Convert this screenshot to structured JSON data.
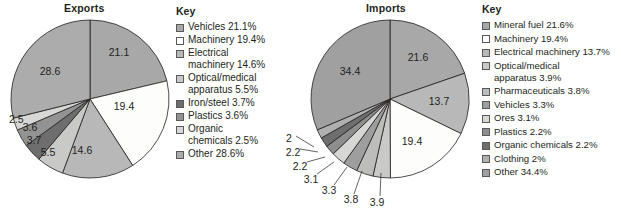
{
  "charts": [
    {
      "id": "exports",
      "title": "Exports",
      "key_title": "Key",
      "legend": [
        {
          "label": "Vehicles 21.1%",
          "color": "#a8a8a8"
        },
        {
          "label": "Machinery 19.4%",
          "color": "#fdfdfb"
        },
        {
          "label": "Electrical\nmachinery 14.6%",
          "color": "#b8b8b8"
        },
        {
          "label": "Optical/medical\napparatus 5.5%",
          "color": "#c9c9c7"
        },
        {
          "label": "Iron/steel 3.7%",
          "color": "#6e6e6e"
        },
        {
          "label": "Plastics 3.6%",
          "color": "#939393"
        },
        {
          "label": "Organic\nchemicals 2.5%",
          "color": "#d7d7d5"
        },
        {
          "label": "Other 28.6%",
          "color": "#acacac"
        }
      ],
      "slice_labels": [
        "21.1",
        "19.4",
        "14.6",
        "5.5",
        "3.7",
        "3.6",
        "2.5",
        "28.6"
      ]
    },
    {
      "id": "imports",
      "title": "Imports",
      "key_title": "Key",
      "legend": [
        {
          "label": "Mineral fuel 21.6%",
          "color": "#a8a8a8"
        },
        {
          "label": "Machinery 19.4%",
          "color": "#fdfdfb"
        },
        {
          "label": "Electrical machinery 13.7%",
          "color": "#b8b8b8"
        },
        {
          "label": "Optical/medical\napparatus 3.9%",
          "color": "#c9c9c7"
        },
        {
          "label": "Pharmaceuticals 3.8%",
          "color": "#bdbdbb"
        },
        {
          "label": "Vehicles 3.3%",
          "color": "#9e9e9e"
        },
        {
          "label": "Ores 3.1%",
          "color": "#d7d7d5"
        },
        {
          "label": "Plastics 2.2%",
          "color": "#8e8e8e"
        },
        {
          "label": "Organic chemicals 2.2%",
          "color": "#6e6e6e"
        },
        {
          "label": "Clothing 2%",
          "color": "#b0b0b0"
        },
        {
          "label": "Other 34.4%",
          "color": "#a0a0a0"
        }
      ],
      "slice_labels": [
        "21.6",
        "13.7",
        "19.4",
        "3.9",
        "3.8",
        "3.3",
        "3.1",
        "2.2",
        "2.2",
        "2",
        "34.4"
      ]
    }
  ],
  "chart_data": [
    {
      "type": "pie",
      "title": "Exports",
      "categories": [
        "Vehicles",
        "Machinery",
        "Electrical machinery",
        "Optical/medical apparatus",
        "Iron/steel",
        "Plastics",
        "Organic chemicals",
        "Other"
      ],
      "values": [
        21.1,
        19.4,
        14.6,
        5.5,
        3.7,
        3.6,
        2.5,
        28.6
      ],
      "unit": "%",
      "legend_title": "Key",
      "legend_position": "right",
      "colors": [
        "#a8a8a8",
        "#fdfdfb",
        "#b8b8b8",
        "#c9c9c7",
        "#6e6e6e",
        "#939393",
        "#d7d7d5",
        "#acacac"
      ],
      "start_angle_deg": 0,
      "direction": "clockwise",
      "xlabel": "",
      "ylabel": "",
      "grid": false
    },
    {
      "type": "pie",
      "title": "Imports",
      "categories": [
        "Mineral fuel",
        "Electrical machinery",
        "Machinery",
        "Optical/medical apparatus",
        "Pharmaceuticals",
        "Vehicles",
        "Ores",
        "Plastics",
        "Organic chemicals",
        "Clothing",
        "Other"
      ],
      "values": [
        21.6,
        13.7,
        19.4,
        3.9,
        3.8,
        3.3,
        3.1,
        2.2,
        2.2,
        2.0,
        34.4
      ],
      "unit": "%",
      "legend_title": "Key",
      "legend_position": "right",
      "colors": [
        "#a8a8a8",
        "#b8b8b8",
        "#fdfdfb",
        "#c9c9c7",
        "#bdbdbb",
        "#9e9e9e",
        "#d7d7d5",
        "#8e8e8e",
        "#6e6e6e",
        "#b0b0b0",
        "#a0a0a0"
      ],
      "start_angle_deg": 0,
      "direction": "clockwise",
      "xlabel": "",
      "ylabel": "",
      "grid": false
    }
  ]
}
